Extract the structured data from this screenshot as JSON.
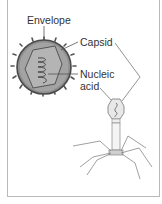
{
  "diagram": {
    "labels": {
      "envelope": "Envelope",
      "capsid": "Capsid",
      "nucleic_acid_line1": "Nucleic",
      "nucleic_acid_line2": "acid"
    },
    "structures": [
      {
        "name": "enveloped-virus",
        "parts": [
          "envelope",
          "capsid",
          "nucleic-acid"
        ]
      },
      {
        "name": "bacteriophage",
        "parts": [
          "capsid-head",
          "nucleic-acid",
          "tail",
          "base-plate",
          "tail-fibers"
        ]
      }
    ],
    "colors": {
      "frame": "#b9b9b9",
      "envelope_fill": "#8f8f8f",
      "envelope_spikes": "#5a5a5a",
      "capsid_fill": "#bdbdbd",
      "text": "#333333",
      "lines": "#555555"
    }
  }
}
